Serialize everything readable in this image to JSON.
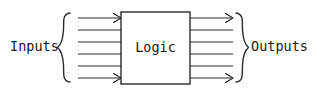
{
  "diagram": {
    "type": "block-diagram",
    "background_color": "#ffffff",
    "stroke_color": "#2b2b2b",
    "text_color": "#1a1a1a",
    "labels": {
      "inputs": "Inputs",
      "logic": "Logic",
      "outputs": "Outputs"
    },
    "block": {
      "label": "Logic",
      "x": 121,
      "y": 12,
      "width": 69,
      "height": 72
    },
    "input_group": {
      "label": "Inputs",
      "label_x": 10,
      "label_y": 47,
      "brace_type": "left-curly-brace",
      "brace_x": 60,
      "brace_top": 12,
      "brace_bottom": 84,
      "line_count": 6,
      "line_x_start": 78,
      "line_x_end": 121,
      "line_y_positions": [
        18,
        30,
        42,
        54,
        66,
        78
      ],
      "arrowhead_on": [
        0,
        5
      ]
    },
    "output_group": {
      "label": "Outputs",
      "label_x": 252,
      "label_y": 47,
      "brace_type": "right-curly-brace",
      "brace_x": 242,
      "brace_top": 12,
      "brace_bottom": 84,
      "line_count": 6,
      "line_x_start": 190,
      "line_x_end": 233,
      "line_y_positions": [
        18,
        30,
        42,
        54,
        66,
        78
      ],
      "arrowhead_on": [
        0,
        5
      ]
    }
  }
}
